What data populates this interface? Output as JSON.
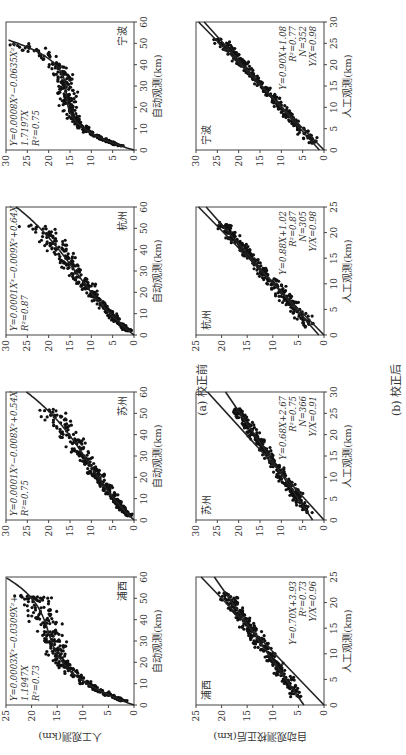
{
  "figure": {
    "caption_a": "(a) 校正前",
    "caption_b": "(b) 校正后",
    "ylabel_a": "人工观测(km)",
    "ylabel_b": "自动观测校正后(km)",
    "xlabel_a": "自动观测(km)",
    "xlabel_b": "人工观测(km)"
  },
  "chart_data": [
    {
      "type": "scatter",
      "panel": "a",
      "station": "浦西",
      "xlabel": "自动观测(km)",
      "ylabel": "人工观测(km)",
      "xlim": [
        0,
        60
      ],
      "ylim": [
        0,
        25
      ],
      "xticks": [
        0,
        10,
        20,
        30,
        40,
        50,
        60
      ],
      "yticks": [
        0,
        5,
        10,
        15,
        20,
        25
      ],
      "fit": "Y=0.0003X³−0.0309X²+1.1947X",
      "fit_coef": [
        0.0003,
        -0.0309,
        1.1947,
        0
      ],
      "r2": "R²=0.73"
    },
    {
      "type": "scatter",
      "panel": "a",
      "station": "苏州",
      "xlabel": "自动观测(km)",
      "ylabel": "",
      "xlim": [
        0,
        60
      ],
      "ylim": [
        0,
        30
      ],
      "xticks": [
        0,
        10,
        20,
        30,
        40,
        50,
        60
      ],
      "yticks": [
        0,
        5,
        10,
        15,
        20,
        25,
        30
      ],
      "fit": "Y=0.0001X³−0.008X²+0.54X",
      "fit_coef": [
        0.0001,
        -0.008,
        0.54,
        0
      ],
      "r2": "R²=0.75"
    },
    {
      "type": "scatter",
      "panel": "a",
      "station": "杭州",
      "xlabel": "自动观测(km)",
      "ylabel": "",
      "xlim": [
        0,
        60
      ],
      "ylim": [
        0,
        30
      ],
      "xticks": [
        0,
        10,
        20,
        30,
        40,
        50,
        60
      ],
      "yticks": [
        0,
        5,
        10,
        15,
        20,
        25,
        30
      ],
      "fit": "Y=0.0001X³−0.009X²+0.64X",
      "fit_coef": [
        0.0001,
        -0.009,
        0.64,
        0
      ],
      "r2": "R²=0.87"
    },
    {
      "type": "scatter",
      "panel": "a",
      "station": "宁波",
      "xlabel": "自动观测(km)",
      "ylabel": "",
      "xlim": [
        0,
        60
      ],
      "ylim": [
        0,
        30
      ],
      "xticks": [
        0,
        10,
        20,
        30,
        40,
        50,
        60
      ],
      "yticks": [
        0,
        5,
        10,
        15,
        20,
        25,
        30
      ],
      "fit": "Y=0.0008X³−0.0635X²+1.7197X",
      "fit_coef": [
        0.0008,
        -0.0635,
        1.7197,
        0
      ],
      "r2": "R²=0.75"
    },
    {
      "type": "scatter",
      "panel": "b",
      "station": "浦西",
      "xlabel": "人工观测(km)",
      "ylabel": "自动观测校正后(km)",
      "xlim": [
        0,
        25
      ],
      "ylim": [
        0,
        25
      ],
      "xticks": [
        0,
        5,
        10,
        15,
        20,
        25
      ],
      "yticks": [
        0,
        5,
        10,
        15,
        20,
        25
      ],
      "fit": "Y=0.70X+3.93",
      "fit_line": [
        0.7,
        3.93
      ],
      "r2": "R²=0.73",
      "yx": "Y/X=0.96",
      "yx_val": 0.96
    },
    {
      "type": "scatter",
      "panel": "b",
      "station": "苏州",
      "xlabel": "人工观测(km)",
      "ylabel": "",
      "xlim": [
        0,
        30
      ],
      "ylim": [
        0,
        30
      ],
      "xticks": [
        0,
        5,
        10,
        15,
        20,
        25,
        30
      ],
      "yticks": [
        0,
        5,
        10,
        15,
        20,
        25,
        30
      ],
      "fit": "Y=0.68X+2.67",
      "fit_line": [
        0.68,
        2.67
      ],
      "r2": "R²=0.75",
      "n": "N=366",
      "yx": "Y/X=0.91",
      "yx_val": 0.91
    },
    {
      "type": "scatter",
      "panel": "b",
      "station": "杭州",
      "xlabel": "人工观测(km)",
      "ylabel": "",
      "xlim": [
        0,
        25
      ],
      "ylim": [
        0,
        25
      ],
      "xticks": [
        0,
        5,
        10,
        15,
        20,
        25
      ],
      "yticks": [
        0,
        5,
        10,
        15,
        20,
        25
      ],
      "fit": "Y=0.88X+1.02",
      "fit_line": [
        0.88,
        1.02
      ],
      "r2": "R²=0.87",
      "n": "N=305",
      "yx": "Y/X=0.98",
      "yx_val": 0.98
    },
    {
      "type": "scatter",
      "panel": "b",
      "station": "宁波",
      "xlabel": "人工观测(km)",
      "ylabel": "",
      "xlim": [
        0,
        30
      ],
      "ylim": [
        0,
        30
      ],
      "xticks": [
        0,
        5,
        10,
        15,
        20,
        25,
        30
      ],
      "yticks": [
        0,
        5,
        10,
        15,
        20,
        25,
        30
      ],
      "fit": "Y=0.90X+1.08",
      "fit_line": [
        0.9,
        1.08
      ],
      "r2": "R²=0.77",
      "n": "N=352",
      "yx": "Y/X=0.98",
      "yx_val": 0.98
    }
  ]
}
